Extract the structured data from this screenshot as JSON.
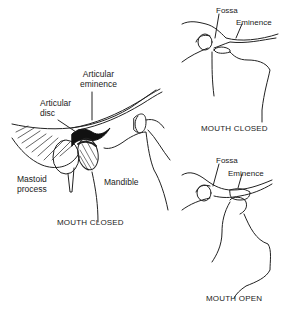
{
  "main_diagram": {
    "labels": {
      "articular_eminence_line1": "Articular",
      "articular_eminence_line2": "eminence",
      "articular_disc_line1": "Articular",
      "articular_disc_line2": "disc",
      "mastoid_line1": "Mastoid",
      "mastoid_line2": "process",
      "mandible": "Mandible"
    },
    "caption": "MOUTH CLOSED"
  },
  "top_right_diagram": {
    "labels": {
      "fossa": "Fossa",
      "eminence": "Eminence"
    },
    "caption": "MOUTH CLOSED"
  },
  "bottom_right_diagram": {
    "labels": {
      "fossa": "Fossa",
      "eminence": "Eminence"
    },
    "caption": "MOUTH OPEN"
  }
}
